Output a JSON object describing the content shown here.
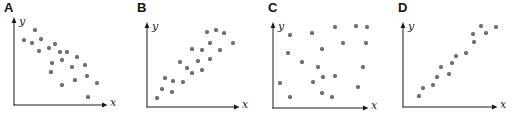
{
  "figure": {
    "background": "#ffffff",
    "axis_color": "#1a1a1a",
    "dot_core_color": "#8c8c8c",
    "dot_edge_color": "#3a3a3a"
  },
  "chart_data": [
    {
      "type": "scatter",
      "panel_label": "A",
      "xlabel": "x",
      "ylabel": "y",
      "correlation": "negative",
      "xlim": [
        0,
        10
      ],
      "ylim": [
        0,
        10
      ],
      "grid": false,
      "x": [
        2.4,
        1.1,
        3.0,
        2.0,
        3.9,
        2.8,
        4.6,
        5.2,
        6.0,
        4.3,
        5.4,
        7.1,
        4.2,
        6.5,
        8.0,
        5.4,
        6.9,
        8.2,
        9.3,
        8.3
      ],
      "y": [
        8.8,
        7.6,
        7.8,
        7.3,
        6.7,
        6.4,
        7.2,
        6.2,
        6.2,
        4.9,
        5.3,
        5.6,
        3.9,
        4.5,
        4.7,
        2.4,
        2.9,
        3.4,
        2.6,
        0.9
      ]
    },
    {
      "type": "scatter",
      "panel_label": "B",
      "xlabel": "x",
      "ylabel": "y",
      "correlation": "positive",
      "xlim": [
        0,
        10
      ],
      "ylim": [
        0,
        10
      ],
      "grid": false,
      "x": [
        6.8,
        7.8,
        8.8,
        7.2,
        9.8,
        5.1,
        6.3,
        8.3,
        5.8,
        7.2,
        3.8,
        4.5,
        6.3,
        5.1,
        2.0,
        3.0,
        4.1,
        1.7,
        2.8,
        1.1
      ],
      "y": [
        9.0,
        9.3,
        8.9,
        7.7,
        7.7,
        7.0,
        6.9,
        6.9,
        5.5,
        5.8,
        5.4,
        4.7,
        4.5,
        4.1,
        3.5,
        3.1,
        3.0,
        2.2,
        1.8,
        1.1
      ]
    },
    {
      "type": "scatter",
      "panel_label": "C",
      "xlabel": "x",
      "ylabel": "y",
      "correlation": "none",
      "xlim": [
        0,
        10
      ],
      "ylim": [
        0,
        10
      ],
      "grid": false,
      "x": [
        6.6,
        8.8,
        10.0,
        1.8,
        4.1,
        7.4,
        9.9,
        1.6,
        5.2,
        3.1,
        4.8,
        9.6,
        4.3,
        5.3,
        6.6,
        0.7,
        9.0,
        5.2,
        6.3,
        1.8
      ],
      "y": [
        9.6,
        9.8,
        9.6,
        8.7,
        8.9,
        7.7,
        7.7,
        6.5,
        7.0,
        5.5,
        4.9,
        4.9,
        3.1,
        3.7,
        3.8,
        3.0,
        2.5,
        1.8,
        1.3,
        1.3
      ]
    },
    {
      "type": "scatter",
      "panel_label": "D",
      "xlabel": "x",
      "ylabel": "y",
      "correlation": "strong positive",
      "xlim": [
        0,
        10
      ],
      "ylim": [
        0,
        10
      ],
      "grid": false,
      "x": [
        8.4,
        10.0,
        8.9,
        7.5,
        7.6,
        6.8,
        5.7,
        5.3,
        4.1,
        4.9,
        3.7,
        3.2,
        2.2,
        1.7
      ],
      "y": [
        9.8,
        9.6,
        8.9,
        8.8,
        7.8,
        6.5,
        6.1,
        5.3,
        4.8,
        4.0,
        3.6,
        2.7,
        2.3,
        1.3
      ]
    }
  ]
}
